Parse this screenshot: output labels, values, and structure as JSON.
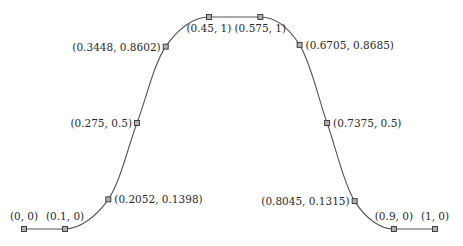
{
  "diagram": {
    "curve_color": "#555555",
    "marker_fill": "#b0b0b0",
    "marker_stroke": "#333333",
    "points": [
      {
        "x": 0,
        "y": 0,
        "label": "(0, 0)",
        "pos": "above"
      },
      {
        "x": 0.1,
        "y": 0,
        "label": "(0.1, 0)",
        "pos": "above"
      },
      {
        "x": 0.2052,
        "y": 0.1398,
        "label": "(0.2052, 0.1398)",
        "pos": "right"
      },
      {
        "x": 0.275,
        "y": 0.5,
        "label": "(0.275, 0.5)",
        "pos": "left"
      },
      {
        "x": 0.3448,
        "y": 0.8602,
        "label": "(0.3448, 0.8602)",
        "pos": "left"
      },
      {
        "x": 0.45,
        "y": 1,
        "label": "(0.45, 1)",
        "pos": "below"
      },
      {
        "x": 0.575,
        "y": 1,
        "label": "(0.575, 1)",
        "pos": "below"
      },
      {
        "x": 0.6705,
        "y": 0.8685,
        "label": "(0.6705, 0.8685)",
        "pos": "right"
      },
      {
        "x": 0.7375,
        "y": 0.5,
        "label": "(0.7375, 0.5)",
        "pos": "right"
      },
      {
        "x": 0.8045,
        "y": 0.1315,
        "label": "(0.8045, 0.1315)",
        "pos": "left"
      },
      {
        "x": 0.9,
        "y": 0,
        "label": "(0.9, 0)",
        "pos": "above"
      },
      {
        "x": 1,
        "y": 0,
        "label": "(1, 0)",
        "pos": "above"
      }
    ]
  },
  "chart_data": {
    "type": "line",
    "title": "",
    "xlabel": "",
    "ylabel": "",
    "x": [
      0,
      0.1,
      0.2052,
      0.275,
      0.3448,
      0.45,
      0.575,
      0.6705,
      0.7375,
      0.8045,
      0.9,
      1
    ],
    "y": [
      0,
      0,
      0.1398,
      0.5,
      0.8602,
      1,
      1,
      0.8685,
      0.5,
      0.1315,
      0,
      0
    ],
    "xlim": [
      0,
      1
    ],
    "ylim": [
      0,
      1
    ],
    "grid": false,
    "axes_visible": false
  }
}
